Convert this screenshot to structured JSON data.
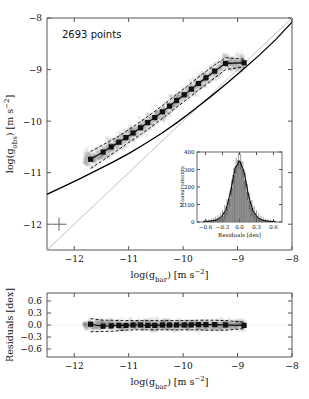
{
  "figure": {
    "annotation": "2693 points"
  },
  "chart_data": [
    {
      "type": "scatter",
      "name": "main-panel",
      "title": "",
      "xlabel": "log(g_bar) [m s^-2]",
      "ylabel": "log(g_obs) [m s^-2]",
      "xlabel_parts": {
        "pre": "log(g",
        "sub": "bar",
        "post": ") [m s",
        "sup": "−2",
        "tail": "]"
      },
      "ylabel_parts": {
        "pre": "log(g",
        "sub": "obs",
        "post": ") [m s",
        "sup": "−2",
        "tail": "]"
      },
      "xlim": [
        -12.5,
        -8.0
      ],
      "ylim": [
        -12.5,
        -8.0
      ],
      "xticks": [
        -12,
        -11,
        -10,
        -9,
        -8
      ],
      "yticks": [
        -8,
        -9,
        -10,
        -11,
        -12
      ],
      "xticklabels": [
        "−12",
        "−11",
        "−10",
        "−9",
        "−8"
      ],
      "yticklabels": [
        "−8",
        "−9",
        "−10",
        "−11",
        "−12"
      ],
      "grid": false,
      "n_points": 2693,
      "legend": "none",
      "series": [
        {
          "name": "unity-line",
          "style": "solid-grey",
          "x": [
            -12.5,
            -8.0
          ],
          "y": [
            -12.5,
            -8.0
          ]
        },
        {
          "name": "rar-fit-curve",
          "style": "solid-black",
          "x": [
            -12.5,
            -12.2,
            -11.9,
            -11.6,
            -11.3,
            -11.0,
            -10.7,
            -10.4,
            -10.1,
            -9.8,
            -9.5,
            -9.2,
            -8.9,
            -8.6,
            -8.3,
            -8.0
          ],
          "y": [
            -11.42,
            -11.27,
            -11.12,
            -10.96,
            -10.8,
            -10.63,
            -10.44,
            -10.24,
            -10.02,
            -9.78,
            -9.53,
            -9.27,
            -9.0,
            -8.72,
            -8.42,
            -8.08
          ]
        },
        {
          "name": "binned-means",
          "style": "squares-with-line",
          "x": [
            -11.7,
            -11.47,
            -11.32,
            -11.18,
            -11.05,
            -10.92,
            -10.78,
            -10.65,
            -10.52,
            -10.38,
            -10.25,
            -10.12,
            -9.98,
            -9.85,
            -9.72,
            -9.58,
            -9.42,
            -9.22,
            -8.88
          ],
          "y": [
            -10.74,
            -10.6,
            -10.5,
            -10.41,
            -10.32,
            -10.23,
            -10.13,
            -10.03,
            -9.93,
            -9.82,
            -9.71,
            -9.6,
            -9.49,
            -9.38,
            -9.27,
            -9.16,
            -9.03,
            -8.88,
            -8.87
          ]
        },
        {
          "name": "envelope-upper",
          "style": "dashed-black",
          "x": [
            -11.7,
            -11.47,
            -11.32,
            -11.18,
            -11.05,
            -10.92,
            -10.78,
            -10.65,
            -10.52,
            -10.38,
            -10.25,
            -10.12,
            -9.98,
            -9.85,
            -9.72,
            -9.58,
            -9.42,
            -9.22,
            -8.88
          ],
          "y": [
            -10.59,
            -10.46,
            -10.37,
            -10.29,
            -10.2,
            -10.11,
            -10.01,
            -9.91,
            -9.81,
            -9.7,
            -9.59,
            -9.48,
            -9.37,
            -9.26,
            -9.15,
            -9.04,
            -8.91,
            -8.77,
            -8.8
          ]
        },
        {
          "name": "envelope-lower",
          "style": "dashed-black",
          "x": [
            -11.7,
            -11.47,
            -11.32,
            -11.18,
            -11.05,
            -10.92,
            -10.78,
            -10.65,
            -10.52,
            -10.38,
            -10.25,
            -10.12,
            -9.98,
            -9.85,
            -9.72,
            -9.58,
            -9.42,
            -9.22,
            -8.88
          ],
          "y": [
            -10.92,
            -10.76,
            -10.65,
            -10.55,
            -10.45,
            -10.36,
            -10.26,
            -10.16,
            -10.06,
            -9.95,
            -9.84,
            -9.73,
            -9.62,
            -9.51,
            -9.4,
            -9.29,
            -9.16,
            -9.0,
            -8.95
          ]
        }
      ],
      "error_bar_marker": {
        "x": -12.28,
        "y": -12.0,
        "xerr": 0.14,
        "yerr": 0.13
      }
    },
    {
      "type": "bar",
      "name": "inset-histogram",
      "title": "",
      "xlabel": "Residuals [dex]",
      "ylabel": "Measurements",
      "xlim": [
        -0.75,
        0.75
      ],
      "ylim": [
        0,
        400
      ],
      "xticks": [
        -0.6,
        -0.3,
        0.0,
        0.3,
        0.6
      ],
      "yticks": [
        0,
        100,
        200,
        300,
        400
      ],
      "xticklabels": [
        "−0.6",
        "−0.3",
        "0.0",
        "0.3",
        "0.6"
      ],
      "yticklabels": [
        "0",
        "100",
        "200",
        "300",
        "400"
      ],
      "grid": false,
      "bin_centers": [
        -0.62,
        -0.58,
        -0.54,
        -0.5,
        -0.46,
        -0.42,
        -0.38,
        -0.34,
        -0.3,
        -0.26,
        -0.22,
        -0.18,
        -0.14,
        -0.1,
        -0.06,
        -0.02,
        0.02,
        0.06,
        0.1,
        0.14,
        0.18,
        0.22,
        0.26,
        0.3,
        0.34,
        0.38,
        0.42,
        0.46,
        0.5,
        0.54,
        0.58,
        0.62
      ],
      "values": [
        2,
        3,
        4,
        6,
        8,
        11,
        15,
        22,
        35,
        55,
        85,
        130,
        195,
        265,
        320,
        350,
        345,
        300,
        235,
        170,
        118,
        80,
        52,
        34,
        22,
        14,
        9,
        6,
        4,
        3,
        2,
        1
      ],
      "curve": {
        "name": "gaussian-fit",
        "x": [
          -0.64,
          -0.56,
          -0.48,
          -0.4,
          -0.32,
          -0.24,
          -0.16,
          -0.08,
          0.0,
          0.08,
          0.16,
          0.24,
          0.32,
          0.4,
          0.48,
          0.56,
          0.64
        ],
        "y": [
          2,
          4,
          7,
          13,
          30,
          68,
          168,
          305,
          350,
          290,
          150,
          62,
          26,
          11,
          6,
          3,
          2
        ]
      }
    },
    {
      "type": "scatter",
      "name": "residual-panel",
      "title": "",
      "xlabel": "log(g_bar) [m s^-2]",
      "ylabel": "Residuals [dex]",
      "xlim": [
        -12.5,
        -8.0
      ],
      "ylim": [
        -0.8,
        0.8
      ],
      "xticks": [
        -12,
        -11,
        -10,
        -9,
        -8
      ],
      "yticks": [
        0.6,
        0.3,
        0.0,
        -0.3,
        -0.6
      ],
      "xticklabels": [
        "−12",
        "−11",
        "−10",
        "−9",
        "−8"
      ],
      "yticklabels": [
        "0.6",
        "0.3",
        "0.0",
        "−0.3",
        "−0.6"
      ],
      "grid": false,
      "series": [
        {
          "name": "zero-line",
          "style": "dotted-grey",
          "x": [
            -12.5,
            -8.0
          ],
          "y": [
            0.0,
            0.0
          ]
        },
        {
          "name": "binned-residual-means",
          "style": "squares-with-line",
          "x": [
            -11.7,
            -11.47,
            -11.32,
            -11.18,
            -11.05,
            -10.92,
            -10.78,
            -10.65,
            -10.52,
            -10.38,
            -10.25,
            -10.12,
            -9.98,
            -9.85,
            -9.72,
            -9.58,
            -9.42,
            -9.22,
            -8.88
          ],
          "y": [
            0.02,
            -0.03,
            -0.02,
            -0.01,
            -0.01,
            0.0,
            0.0,
            -0.01,
            -0.01,
            0.0,
            0.0,
            0.0,
            0.0,
            0.0,
            0.01,
            0.01,
            0.01,
            0.0,
            -0.01
          ]
        },
        {
          "name": "residual-envelope-upper",
          "style": "dashed-black",
          "x": [
            -11.7,
            -11.47,
            -11.32,
            -11.18,
            -11.05,
            -10.92,
            -10.78,
            -10.65,
            -10.52,
            -10.38,
            -10.25,
            -10.12,
            -9.98,
            -9.85,
            -9.72,
            -9.58,
            -9.42,
            -9.22,
            -8.88
          ],
          "y": [
            0.16,
            0.12,
            0.12,
            0.11,
            0.11,
            0.11,
            0.11,
            0.11,
            0.11,
            0.11,
            0.11,
            0.11,
            0.11,
            0.11,
            0.12,
            0.12,
            0.12,
            0.11,
            0.07
          ]
        },
        {
          "name": "residual-envelope-lower",
          "style": "dashed-black",
          "x": [
            -11.7,
            -11.47,
            -11.32,
            -11.18,
            -11.05,
            -10.92,
            -10.78,
            -10.65,
            -10.52,
            -10.38,
            -10.25,
            -10.12,
            -9.98,
            -9.85,
            -9.72,
            -9.58,
            -9.42,
            -9.22,
            -8.88
          ],
          "y": [
            -0.17,
            -0.16,
            -0.16,
            -0.14,
            -0.13,
            -0.12,
            -0.12,
            -0.12,
            -0.12,
            -0.12,
            -0.12,
            -0.12,
            -0.12,
            -0.12,
            -0.12,
            -0.13,
            -0.13,
            -0.13,
            -0.09
          ]
        }
      ]
    }
  ]
}
